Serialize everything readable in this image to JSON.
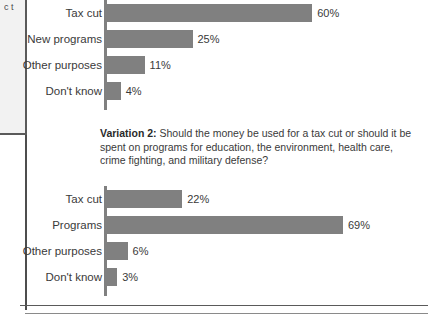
{
  "sidebar_fragment": {
    "clipped_text": "c\nt"
  },
  "caption": {
    "label": "Variation 2:",
    "text": " Should the money be used for a tax cut or should it be spent on programs for education, the environment, health care, crime fighting, and military defense?"
  },
  "chart_data": [
    {
      "type": "bar",
      "orientation": "horizontal",
      "title": "",
      "xlabel": "",
      "ylabel": "",
      "xlim": [
        0,
        100
      ],
      "grid": false,
      "legend": false,
      "bar_color": "#808080",
      "categories": [
        "Tax cut",
        "New programs",
        "Other purposes",
        "Don't know"
      ],
      "values": [
        60,
        25,
        11,
        4
      ],
      "value_labels": [
        "60%",
        "25%",
        "11%",
        "4%"
      ]
    },
    {
      "type": "bar",
      "orientation": "horizontal",
      "title": "",
      "xlabel": "",
      "ylabel": "",
      "xlim": [
        0,
        100
      ],
      "grid": false,
      "legend": false,
      "bar_color": "#808080",
      "categories": [
        "Tax cut",
        "Programs",
        "Other purposes",
        "Don't know"
      ],
      "values": [
        22,
        69,
        6,
        3
      ],
      "value_labels": [
        "22%",
        "69%",
        "6%",
        "3%"
      ]
    }
  ]
}
